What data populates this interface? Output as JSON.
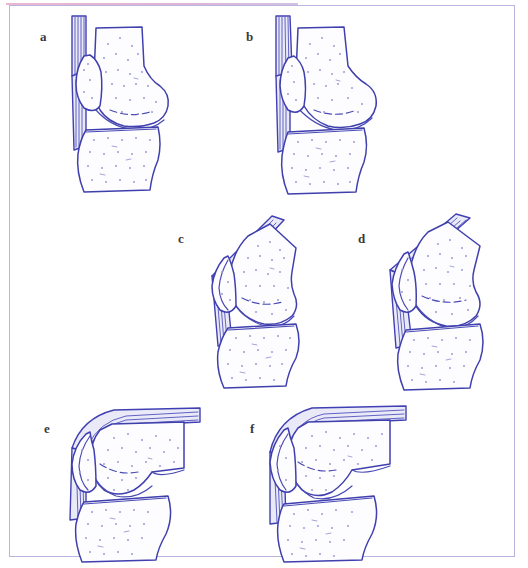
{
  "figure": {
    "panel_count": 6,
    "frame_color": "#b9b6dd",
    "accent_rule_color": "#e8a8c8",
    "ink_color": "#3f3fae",
    "stipple_color": "#9a9ad4",
    "background_color": "#ffffff"
  },
  "panels": [
    {
      "label": "a",
      "label_x": 40,
      "label_y": 30,
      "figure_x": 46,
      "figure_y": 14,
      "flexion_caption": "0 degrees extension",
      "structures": [
        "femur",
        "patella",
        "tibia",
        "quadriceps tendon",
        "patellar tendon"
      ]
    },
    {
      "label": "b",
      "label_x": 246,
      "label_y": 30,
      "figure_x": 252,
      "figure_y": 14,
      "flexion_caption": "20 degrees flexion",
      "structures": [
        "femur",
        "patella",
        "tibia",
        "quadriceps tendon",
        "patellar tendon"
      ]
    },
    {
      "label": "c",
      "label_x": 178,
      "label_y": 232,
      "figure_x": 184,
      "figure_y": 212,
      "flexion_caption": "45 degrees flexion",
      "structures": [
        "femur",
        "patella",
        "tibia",
        "quadriceps tendon",
        "patellar tendon"
      ]
    },
    {
      "label": "d",
      "label_x": 358,
      "label_y": 232,
      "figure_x": 366,
      "figure_y": 212,
      "flexion_caption": "60 degrees flexion",
      "structures": [
        "femur",
        "patella",
        "tibia",
        "quadriceps tendon",
        "patellar tendon"
      ]
    },
    {
      "label": "e",
      "label_x": 44,
      "label_y": 422,
      "figure_x": 52,
      "figure_y": 400,
      "flexion_caption": "90 degrees flexion",
      "structures": [
        "femur",
        "patella",
        "tibia",
        "quadriceps tendon",
        "patellar tendon"
      ]
    },
    {
      "label": "f",
      "label_x": 250,
      "label_y": 422,
      "figure_x": 256,
      "figure_y": 400,
      "flexion_caption": "120 degrees flexion",
      "structures": [
        "femur",
        "patella",
        "tibia",
        "quadriceps tendon",
        "patellar tendon"
      ]
    }
  ]
}
